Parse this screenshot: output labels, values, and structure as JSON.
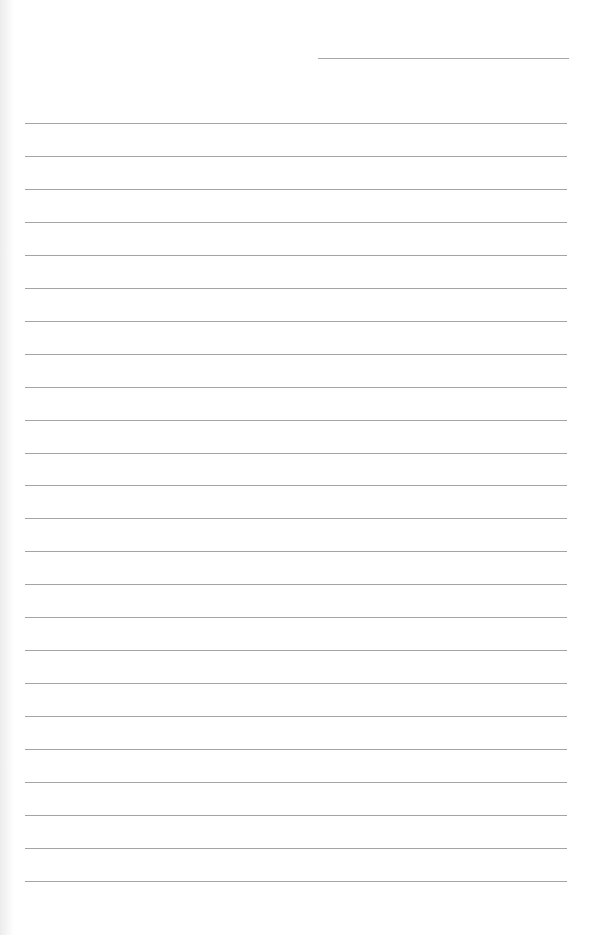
{
  "page": {
    "type": "lined-paper",
    "background": "#ffffff",
    "line_color": "#a4a4a4",
    "header_line": {
      "x_start": 318,
      "x_end": 569,
      "y": 58
    },
    "rules": {
      "count": 24,
      "x_start": 25,
      "x_end": 567,
      "first_y": 123,
      "spacing": 32.95
    },
    "text": []
  }
}
